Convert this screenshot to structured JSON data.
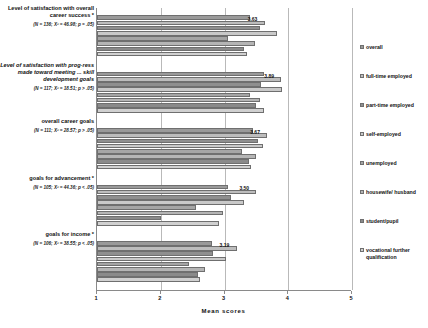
{
  "chart_data": {
    "type": "bar",
    "orientation": "horizontal",
    "title": "",
    "xlabel": "Mean scores",
    "ylabel": "",
    "xlim": [
      1,
      5
    ],
    "xticks": [
      "1",
      "2",
      "3",
      "4",
      "5"
    ],
    "grid": true,
    "legend_position": "right",
    "categories": [
      {
        "title": "Level of satisfaction with overall career success *",
        "stat": "(N = 136; X² = 46.98; p = .05)",
        "italic": false,
        "label": "3.63"
      },
      {
        "title": "Level of satisfaction with prog-ress made toward meeting ... skill development goals",
        "stat": "(N = 117; X² = 18.51; p > .05)",
        "italic": true,
        "label": "3.89"
      },
      {
        "title": "overall career goals",
        "stat": "(N = 111; X² = 28.57; p > .05)",
        "italic": false,
        "label": "3.67"
      },
      {
        "title": "goals for advancement *",
        "stat": "(N = 105; X² = 44.36; p < .05)",
        "italic": false,
        "label": "3.50"
      },
      {
        "title": "goals for income *",
        "stat": "(N = 106; X² = 38.55; p < .05)",
        "italic": false,
        "label": "3.19"
      }
    ],
    "series": [
      {
        "name": "overall",
        "color": "#9a9a9a",
        "values": [
          3.4,
          3.62,
          3.45,
          3.05,
          2.8
        ]
      },
      {
        "name": "full-time employed",
        "color": "#bdbdbd",
        "values": [
          3.63,
          3.89,
          3.67,
          3.5,
          3.19
        ]
      },
      {
        "name": "part-time employed",
        "color": "#8f8f8f",
        "values": [
          3.55,
          3.58,
          3.52,
          3.1,
          2.82
        ]
      },
      {
        "name": "self-employed",
        "color": "#c9c9c9",
        "values": [
          3.82,
          3.9,
          3.6,
          3.3,
          3.02
        ]
      },
      {
        "name": "unemployed",
        "color": "#a5a5a5",
        "values": [
          3.05,
          3.4,
          3.28,
          2.55,
          2.45
        ]
      },
      {
        "name": "housewife/ husband",
        "color": "#b5b5b5",
        "values": [
          3.48,
          3.55,
          3.5,
          2.98,
          2.7
        ]
      },
      {
        "name": "student/pupil",
        "color": "#8a8a8a",
        "values": [
          3.3,
          3.5,
          3.38,
          2.0,
          2.58
        ]
      },
      {
        "name": "vocational further qualification",
        "color": "#d0d0d0",
        "values": [
          3.35,
          3.62,
          3.42,
          2.92,
          2.62
        ]
      }
    ]
  },
  "legend": {
    "items": [
      {
        "label": "overall"
      },
      {
        "label": "full-time employed"
      },
      {
        "label": "part-time employed"
      },
      {
        "label": "self-employed"
      },
      {
        "label": "unemployed"
      },
      {
        "label": "housewife/ husband"
      },
      {
        "label": "student/pupil"
      },
      {
        "label": "vocational further qualification"
      }
    ]
  }
}
